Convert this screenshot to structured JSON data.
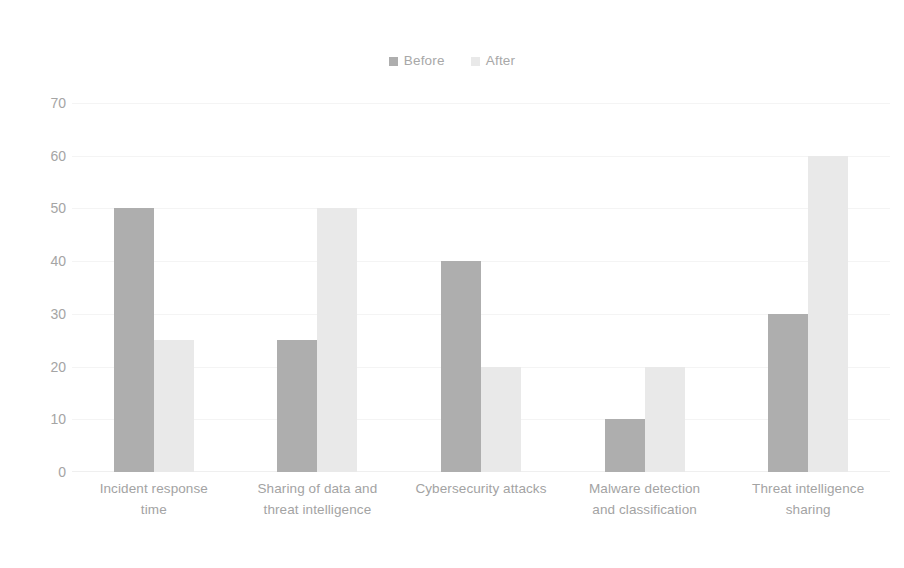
{
  "chart_data": {
    "type": "bar",
    "title": "",
    "subtitle": "",
    "xlabel": "",
    "ylabel": "",
    "ylim": [
      0,
      70
    ],
    "ytick_step": 10,
    "yticks": [
      70,
      60,
      50,
      40,
      30,
      20,
      10,
      0
    ],
    "grid": true,
    "grid_axis": "y",
    "legend_position": "top-center",
    "categories": [
      "Incident response time",
      "Sharing of data and threat intelligence",
      "Cybersecurity attacks",
      "Malware detection and classification",
      "Threat intelligence sharing"
    ],
    "category_lines": [
      [
        "Incident response",
        "time"
      ],
      [
        "Sharing of data and",
        "threat intelligence"
      ],
      [
        "Cybersecurity attacks",
        ""
      ],
      [
        "Malware detection",
        "and classification"
      ],
      [
        "Threat intelligence",
        "sharing"
      ]
    ],
    "series": [
      {
        "name": "Before",
        "color": "#aeaeae",
        "values": [
          50,
          25,
          40,
          10,
          30
        ]
      },
      {
        "name": "After",
        "color": "#e9e9e9",
        "values": [
          25,
          50,
          20,
          20,
          60
        ]
      }
    ]
  },
  "legend": {
    "items": [
      {
        "label": "Before",
        "color": "#aeaeae"
      },
      {
        "label": "After",
        "color": "#e9e9e9"
      }
    ]
  },
  "colors": {
    "before": "#aeaeae",
    "after": "#e9e9e9",
    "gridline": "#f4f4f4",
    "text": "#a3a3a3",
    "background": "#ffffff"
  }
}
